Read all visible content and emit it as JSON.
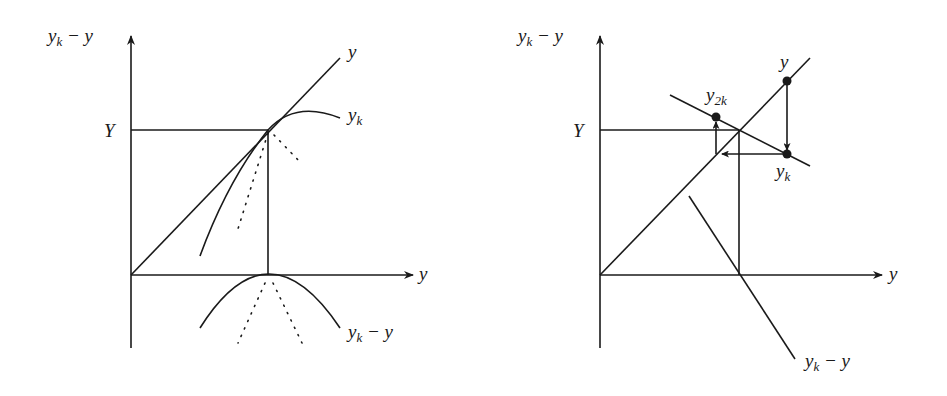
{
  "left_panel": {
    "y_axis_label": {
      "main": "y",
      "sub": "k",
      "rest": " − y"
    },
    "x_axis_label": "y",
    "level_label": "Y",
    "curve_labels": {
      "identity": "y",
      "map": {
        "main": "y",
        "sub": "k"
      },
      "difference": {
        "main": "y",
        "sub": "k",
        "rest": " − y"
      }
    }
  },
  "right_panel": {
    "y_axis_label": {
      "main": "y",
      "sub": "k",
      "rest": " − y"
    },
    "x_axis_label": "y",
    "level_label": "Y",
    "point_labels": {
      "y": "y",
      "y2k": {
        "main": "y",
        "sub": "2k"
      },
      "yk": {
        "main": "y",
        "sub": "k"
      }
    },
    "difference_label": {
      "main": "y",
      "sub": "k",
      "rest": " − y"
    }
  },
  "colors": {
    "ink": "#1a1a1a",
    "background": "#ffffff"
  }
}
